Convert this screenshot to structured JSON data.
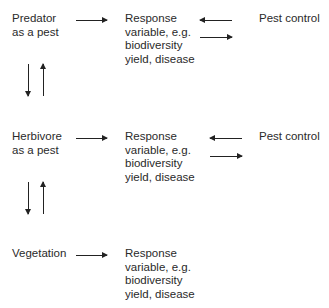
{
  "rows": [
    {
      "source": "Predator\nas a pest",
      "response": "Response\nvariable, e.g.\nbiodiversity\nyield, disease",
      "control": "Pest control"
    },
    {
      "source": "Herbivore\nas a pest",
      "response": "Response\nvariable, e.g.\nbiodiversity\nyield, disease",
      "control": "Pest control"
    },
    {
      "source": "Vegetation",
      "response": "Response\nvariable, e.g.\nbiodiversity\nyield, disease"
    }
  ]
}
